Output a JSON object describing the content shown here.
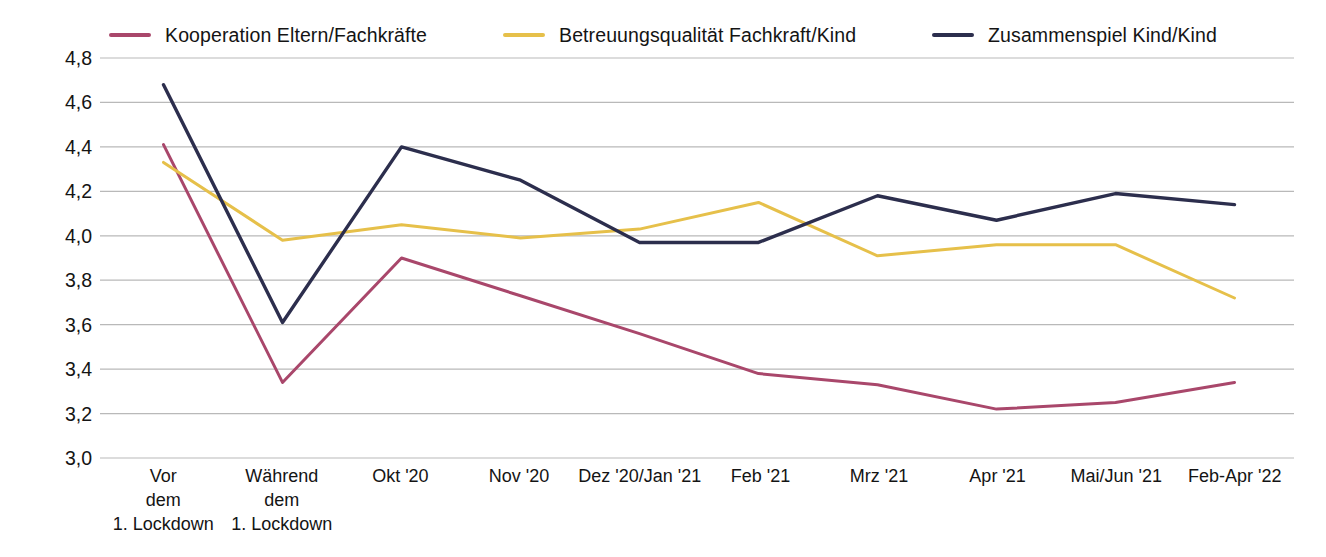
{
  "chart_data": {
    "type": "line",
    "title": "",
    "xlabel": "",
    "ylabel": "",
    "ylim": [
      3.0,
      4.8
    ],
    "ytick_labels": [
      "4,8",
      "4,6",
      "4,4",
      "4,2",
      "4,0",
      "3,8",
      "3,6",
      "3,4",
      "3,2",
      "3,0"
    ],
    "ytick_values": [
      4.8,
      4.6,
      4.4,
      4.2,
      4.0,
      3.8,
      3.6,
      3.4,
      3.2,
      3.0
    ],
    "grid": true,
    "legend_position": "top-center",
    "categories": [
      "Vor dem 1. Lockdown",
      "Während dem 1. Lockdown",
      "Okt '20",
      "Nov '20",
      "Dez '20/Jan '21",
      "Feb '21",
      "Mrz '21",
      "Apr '21",
      "Mai/Jun '21",
      "Feb-Apr '22"
    ],
    "category_lines": [
      [
        "Vor",
        "dem",
        "1. Lockdown"
      ],
      [
        "Während",
        "dem",
        "1. Lockdown"
      ],
      [
        "Okt '20"
      ],
      [
        "Nov '20"
      ],
      [
        "Dez '20/Jan '21"
      ],
      [
        "Feb '21"
      ],
      [
        "Mrz '21"
      ],
      [
        "Apr '21"
      ],
      [
        "Mai/Jun '21"
      ],
      [
        "Feb-Apr '22"
      ]
    ],
    "series": [
      {
        "name": "Kooperation Eltern/Fachkräfte",
        "color": "#a9476b",
        "values": [
          4.41,
          3.34,
          3.9,
          3.73,
          3.56,
          3.38,
          3.33,
          3.22,
          3.25,
          3.34
        ]
      },
      {
        "name": "Betreuungsqualität Fachkraft/Kind",
        "color": "#e6c04a",
        "values": [
          4.33,
          3.98,
          4.05,
          3.99,
          4.03,
          4.15,
          3.91,
          3.96,
          3.96,
          3.72
        ]
      },
      {
        "name": "Zusammenspiel Kind/Kind",
        "color": "#2c2e4d",
        "values": [
          4.68,
          3.61,
          4.4,
          4.25,
          3.97,
          3.97,
          4.18,
          4.07,
          4.19,
          4.14
        ]
      }
    ]
  },
  "legend": {
    "items": [
      {
        "label": "Kooperation Eltern/Fachkräfte",
        "color": "#a9476b"
      },
      {
        "label": "Betreuungsqualität Fachkraft/Kind",
        "color": "#e6c04a"
      },
      {
        "label": "Zusammenspiel Kind/Kind",
        "color": "#2c2e4d"
      }
    ]
  },
  "style": {
    "grid_color": "#b9b9b9",
    "text_color": "#141414",
    "background": "#ffffff"
  }
}
